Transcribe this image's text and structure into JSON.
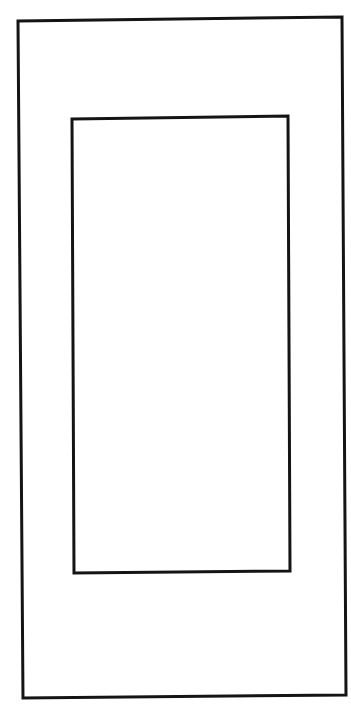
{
  "diagram": {
    "background": "#ffffff",
    "stroke_color": "#141414",
    "shapes": [
      {
        "name": "outer-rectangle",
        "points": "18,21 342,17 346,695 23,698"
      },
      {
        "name": "inner-rectangle",
        "points": "72,119 288,116 290,571 74,573"
      }
    ]
  }
}
